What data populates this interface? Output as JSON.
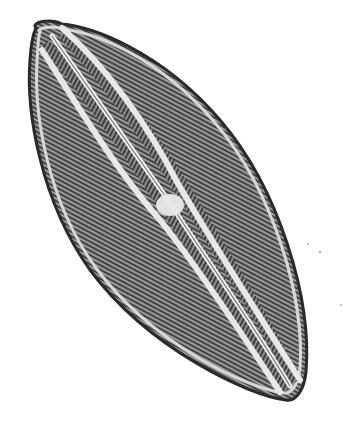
{
  "image": {
    "subject": "diatom frustule under light microscope",
    "description": "Elongated lanceolate diatom valve oriented diagonally (upper-left to lower-right) with a raphe running along its length, a central nodule at mid-valve, longitudinal canals on both sides of the raphe, and fine transverse striae across the valve face, on a white background.",
    "colors": {
      "background": "#ffffff",
      "striae_dark": "#3a3a3a",
      "valve_mid": "#8a8a8a",
      "raphe_light": "#e6e6e6",
      "outline": "#2a2a2a"
    }
  }
}
